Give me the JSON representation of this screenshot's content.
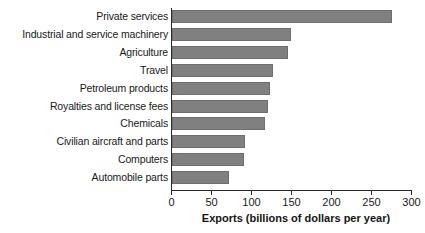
{
  "chart_data": {
    "type": "bar",
    "orientation": "horizontal",
    "title": "",
    "xlabel": "Exports (billions of dollars per year)",
    "ylabel": "",
    "categories": [
      "Private services",
      "Industrial and service machinery",
      "Agriculture",
      "Travel",
      "Petroleum products",
      "Royalties and license fees",
      "Chemicals",
      "Civilian aircraft and parts",
      "Computers",
      "Automobile parts"
    ],
    "values": [
      275,
      149,
      145,
      127,
      123,
      121,
      117,
      92,
      90,
      72
    ],
    "xlim": [
      0,
      300
    ],
    "xticks": [
      0,
      50,
      100,
      150,
      200,
      250,
      300
    ],
    "xtick_labels": [
      "0",
      "50",
      "100",
      "150",
      "200",
      "250",
      "300"
    ],
    "grid": false,
    "legend": false,
    "bar_color": "#808080",
    "bar_edge_color": "#6e6e6e",
    "axis_color": "#2a2a2a"
  }
}
